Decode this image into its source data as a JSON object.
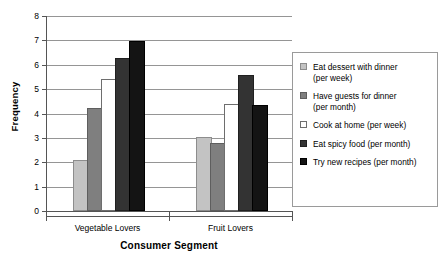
{
  "chart_data": {
    "type": "bar",
    "title": "",
    "xlabel": "Consumer Segment",
    "ylabel": "Frequency",
    "categories": [
      "Vegetable Lovers",
      "Fruit Lovers"
    ],
    "ylim": [
      0,
      8
    ],
    "yticks": [
      0,
      1,
      2,
      3,
      4,
      5,
      6,
      7,
      8
    ],
    "grid": true,
    "legend_position": "right",
    "series": [
      {
        "name": "Eat dessert with dinner\n(per week)",
        "color": "#c3c3c3",
        "values": [
          2.0,
          2.95
        ]
      },
      {
        "name": "Have guests for dinner\n(per month)",
        "color": "#7f7f7f",
        "values": [
          4.15,
          2.7
        ]
      },
      {
        "name": "Cook at home (per week)",
        "color": "#ffffff",
        "values": [
          5.35,
          4.3
        ]
      },
      {
        "name": "Eat spicy food (per month)",
        "color": "#333333",
        "values": [
          6.2,
          5.5
        ]
      },
      {
        "name": "Try new recipes (per month)",
        "color": "#141414",
        "values": [
          6.9,
          4.25
        ]
      }
    ]
  },
  "axis": {
    "y_ticks": [
      "0",
      "1",
      "2",
      "3",
      "4",
      "5",
      "6",
      "7",
      "8"
    ],
    "y_title": "Frequency",
    "x_title": "Consumer Segment",
    "x_categories": [
      "Vegetable Lovers",
      "Fruit Lovers"
    ]
  },
  "legend": {
    "entries": [
      "Eat dessert with dinner\n(per week)",
      "Have guests for dinner\n(per month)",
      "Cook at home (per week)",
      "Eat spicy food (per month)",
      "Try new recipes (per month)"
    ]
  }
}
